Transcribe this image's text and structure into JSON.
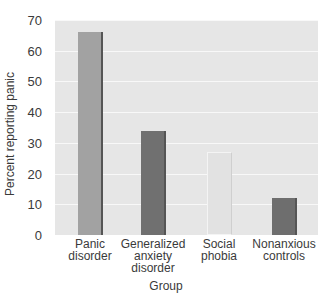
{
  "chart_data": {
    "type": "bar",
    "title": "",
    "xlabel": "Group",
    "ylabel": "Percent reporting panic",
    "ylim": [
      0,
      70
    ],
    "yticks": [
      0,
      10,
      20,
      30,
      40,
      50,
      60,
      70
    ],
    "grid": true,
    "legend": null,
    "categories": [
      "Panic\ndisorder",
      "Generalized\nanxiety\ndisorder",
      "Social\nphobia",
      "Nonanxious\ncontrols"
    ],
    "values": [
      66,
      34,
      27,
      12
    ],
    "bar_colors": [
      "#a2a2a2",
      "#707070",
      "#e2e2e2",
      "#6e6e6e"
    ]
  },
  "colors": {
    "plot_background": "#e6e6e6",
    "gridline": "#f8f8f8",
    "text": "#3a3a3a"
  },
  "labels": {
    "yticks": [
      "0",
      "10",
      "20",
      "30",
      "40",
      "50",
      "60",
      "70"
    ],
    "xticks": [
      "Panic\ndisorder",
      "Generalized\nanxiety\ndisorder",
      "Social\nphobia",
      "Nonanxious\ncontrols"
    ],
    "xlabel": "Group",
    "ylabel": "Percent reporting panic"
  }
}
